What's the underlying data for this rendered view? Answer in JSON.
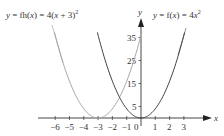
{
  "chart_data": {
    "type": "line",
    "title": "",
    "xlabel": "x",
    "ylabel": "y",
    "xlim": [
      -6.5,
      4.3
    ],
    "ylim": [
      0,
      40
    ],
    "grid": false,
    "x_ticks": [
      "-6",
      "-5",
      "-4",
      "-3",
      "-2",
      "-1",
      "0",
      "1",
      "2",
      "3"
    ],
    "y_ticks": [
      "5",
      "15",
      "25",
      "35"
    ],
    "series": [
      {
        "name": "y = fh(x) = 4(x + 3)^2",
        "color": "#a8a8a8",
        "formula": "4*(x+3)^2",
        "x": [
          -6,
          -5.5,
          -5,
          -4.5,
          -4,
          -3.5,
          -3,
          -2.5,
          -2,
          -1.5,
          -1,
          -0.5,
          0
        ],
        "values": [
          36,
          25,
          16,
          9,
          4,
          1,
          0,
          1,
          4,
          9,
          16,
          25,
          36
        ]
      },
      {
        "name": "y = f(x) = 4x^2",
        "color": "#444444",
        "formula": "4*x^2",
        "x": [
          -3,
          -2.5,
          -2,
          -1.5,
          -1,
          -0.5,
          0,
          0.5,
          1,
          1.5,
          2,
          2.5,
          3
        ],
        "values": [
          36,
          25,
          16,
          9,
          4,
          1,
          0,
          1,
          4,
          9,
          16,
          25,
          36
        ]
      }
    ],
    "annotations": [
      {
        "text_prefix": "y = fh(",
        "var": "x",
        "text_suffix": ") = 4(",
        "var2": "x",
        "text_end": " + 3)",
        "sup": "2"
      },
      {
        "text_prefix": "y = f(",
        "var": "x",
        "text_suffix": ") = 4",
        "var2": "x",
        "sup": "2"
      }
    ]
  },
  "labels": {
    "x_axis": "x",
    "y_axis": "y",
    "origin": "0",
    "eq_left": {
      "a": "y",
      "b": " = fh(",
      "c": "x",
      "d": ") = 4(",
      "e": "x",
      "f": " + 3)",
      "sup": "2"
    },
    "eq_right": {
      "a": "y",
      "b": " = f(",
      "c": "x",
      "d": ") = 4",
      "e": "x",
      "sup": "2"
    }
  }
}
